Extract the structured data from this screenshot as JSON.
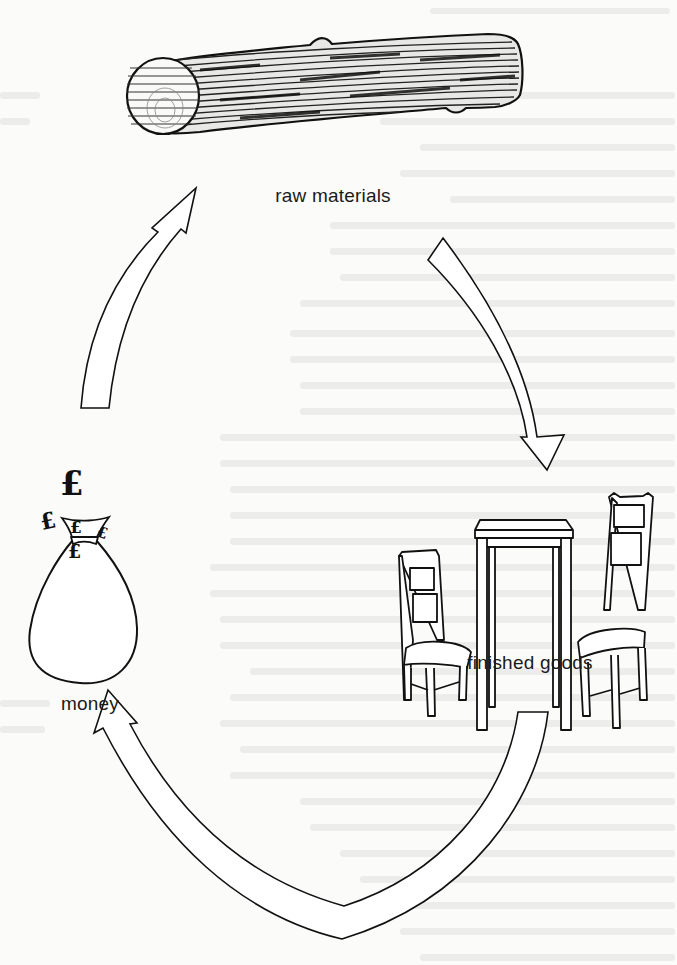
{
  "diagram": {
    "type": "cycle",
    "nodes": [
      {
        "id": "raw",
        "label": "raw materials",
        "icon": "log-icon"
      },
      {
        "id": "goods",
        "label": "finished goods",
        "icon": "table-and-chairs-icon"
      },
      {
        "id": "money",
        "label": "money",
        "icon": "money-bag-icon"
      }
    ],
    "edges": [
      {
        "from": "raw",
        "to": "goods",
        "icon": "curved-arrow-icon"
      },
      {
        "from": "goods",
        "to": "money",
        "icon": "curved-arrow-icon"
      },
      {
        "from": "money",
        "to": "raw",
        "icon": "curved-arrow-icon"
      }
    ],
    "currency_symbol": "£",
    "colors": {
      "ink": "#111111",
      "paper": "#fbfbfa",
      "bleed_through": "#e6e6e4"
    }
  }
}
